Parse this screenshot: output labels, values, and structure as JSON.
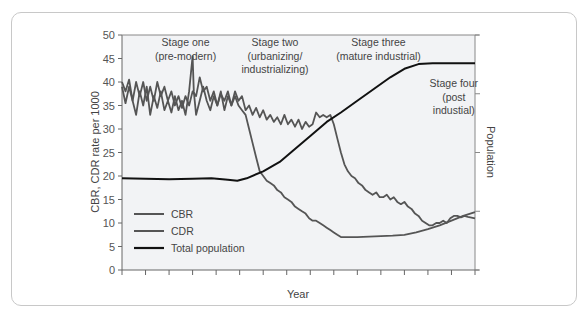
{
  "chart_data": {
    "type": "line",
    "title": "",
    "xlabel": "Year",
    "ylabel": "CBR, CDR rate per 1000",
    "ylabel_right": "Population",
    "ylim": [
      0,
      50
    ],
    "yticks": [
      0,
      5,
      10,
      15,
      20,
      25,
      30,
      35,
      40,
      45,
      50
    ],
    "xlim": [
      0,
      15
    ],
    "xtick_count": 16,
    "right_axis_ticks_count": 5,
    "grid": false,
    "legend_position": "lower-left",
    "legend": [
      "CBR",
      "CDR",
      "Total population"
    ],
    "stages": [
      {
        "label_lines": [
          "Stage one",
          "(pre-modern)"
        ],
        "x": 2.7
      },
      {
        "label_lines": [
          "Stage two",
          "(urbanizing/",
          "industrializing)"
        ],
        "x": 6.5
      },
      {
        "label_lines": [
          "Stage three",
          "(mature industrial)"
        ],
        "x": 10.9
      },
      {
        "label_lines": [
          "Stage four",
          "(post",
          "industial)"
        ],
        "x": 14.1
      }
    ],
    "series": [
      {
        "name": "CBR",
        "color": "#555555",
        "points": [
          [
            0,
            40
          ],
          [
            0.15,
            38
          ],
          [
            0.3,
            40.5
          ],
          [
            0.45,
            36
          ],
          [
            0.6,
            40
          ],
          [
            0.75,
            37
          ],
          [
            0.9,
            40
          ],
          [
            1.05,
            36
          ],
          [
            1.2,
            39
          ],
          [
            1.35,
            36
          ],
          [
            1.5,
            40
          ],
          [
            1.65,
            37
          ],
          [
            1.8,
            39
          ],
          [
            1.95,
            36
          ],
          [
            2.1,
            38
          ],
          [
            2.25,
            35
          ],
          [
            2.4,
            37
          ],
          [
            2.55,
            34.5
          ],
          [
            2.7,
            37
          ],
          [
            2.85,
            35
          ],
          [
            3.0,
            38
          ],
          [
            3.15,
            37
          ],
          [
            3.3,
            41
          ],
          [
            3.45,
            38
          ],
          [
            3.6,
            39
          ],
          [
            3.75,
            36
          ],
          [
            3.9,
            38
          ],
          [
            4.05,
            35
          ],
          [
            4.2,
            37.5
          ],
          [
            4.35,
            36
          ],
          [
            4.5,
            38
          ],
          [
            4.65,
            35
          ],
          [
            4.8,
            38
          ],
          [
            4.95,
            36
          ],
          [
            5.1,
            37
          ],
          [
            5.25,
            34
          ],
          [
            5.4,
            35
          ],
          [
            5.55,
            33
          ],
          [
            5.7,
            34.5
          ],
          [
            5.85,
            32.5
          ],
          [
            6.0,
            34
          ],
          [
            6.15,
            32
          ],
          [
            6.3,
            33
          ],
          [
            6.45,
            31.5
          ],
          [
            6.6,
            32.5
          ],
          [
            6.75,
            31
          ],
          [
            6.9,
            33
          ],
          [
            7.05,
            31
          ],
          [
            7.2,
            32
          ],
          [
            7.35,
            30.5
          ],
          [
            7.5,
            32
          ],
          [
            7.65,
            30
          ],
          [
            7.8,
            31.5
          ],
          [
            7.95,
            30.5
          ],
          [
            8.1,
            31
          ],
          [
            8.25,
            33.5
          ],
          [
            8.4,
            32.5
          ],
          [
            8.55,
            33
          ],
          [
            8.7,
            32.5
          ],
          [
            8.85,
            33
          ],
          [
            9.0,
            31
          ],
          [
            9.15,
            28
          ],
          [
            9.3,
            25
          ],
          [
            9.45,
            22.5
          ],
          [
            9.6,
            21
          ],
          [
            9.75,
            20
          ],
          [
            9.9,
            19.5
          ],
          [
            10.05,
            18.5
          ],
          [
            10.2,
            18
          ],
          [
            10.35,
            17
          ],
          [
            10.5,
            16.5
          ],
          [
            10.65,
            16
          ],
          [
            10.8,
            16.5
          ],
          [
            10.95,
            15.5
          ],
          [
            11.1,
            15.5
          ],
          [
            11.25,
            16
          ],
          [
            11.4,
            15
          ],
          [
            11.55,
            15.5
          ],
          [
            11.7,
            14.5
          ],
          [
            11.85,
            14
          ],
          [
            12.0,
            14.5
          ],
          [
            12.15,
            13.5
          ],
          [
            12.3,
            13
          ],
          [
            12.45,
            12
          ],
          [
            12.6,
            11.5
          ],
          [
            12.75,
            10.5
          ],
          [
            12.9,
            10
          ],
          [
            13.05,
            9.5
          ],
          [
            13.2,
            9.5
          ],
          [
            13.35,
            10
          ],
          [
            13.5,
            10
          ],
          [
            13.65,
            10.5
          ],
          [
            13.8,
            10
          ],
          [
            13.95,
            11
          ],
          [
            14.1,
            11.5
          ],
          [
            14.25,
            11.5
          ],
          [
            14.4,
            11.2
          ],
          [
            14.55,
            11.5
          ],
          [
            14.7,
            11.3
          ],
          [
            15,
            11
          ]
        ]
      },
      {
        "name": "CDR",
        "color": "#555555",
        "points": [
          [
            0,
            39
          ],
          [
            0.15,
            35.5
          ],
          [
            0.3,
            39
          ],
          [
            0.45,
            36
          ],
          [
            0.6,
            33
          ],
          [
            0.75,
            38
          ],
          [
            0.9,
            35
          ],
          [
            1.05,
            39
          ],
          [
            1.2,
            33
          ],
          [
            1.35,
            37
          ],
          [
            1.5,
            34.5
          ],
          [
            1.65,
            38
          ],
          [
            1.8,
            34
          ],
          [
            1.95,
            36
          ],
          [
            2.1,
            33.5
          ],
          [
            2.25,
            37
          ],
          [
            2.4,
            34
          ],
          [
            2.55,
            36
          ],
          [
            2.7,
            33
          ],
          [
            2.85,
            38
          ],
          [
            3.0,
            45.5
          ],
          [
            3.05,
            38
          ],
          [
            3.15,
            33
          ],
          [
            3.3,
            36
          ],
          [
            3.45,
            39
          ],
          [
            3.6,
            36
          ],
          [
            3.75,
            34
          ],
          [
            3.9,
            37
          ],
          [
            4.05,
            35
          ],
          [
            4.2,
            38
          ],
          [
            4.35,
            34
          ],
          [
            4.5,
            37
          ],
          [
            4.65,
            35
          ],
          [
            4.8,
            37
          ],
          [
            4.95,
            35
          ],
          [
            5.1,
            34
          ],
          [
            5.25,
            33
          ],
          [
            5.4,
            30
          ],
          [
            5.55,
            27
          ],
          [
            5.7,
            24
          ],
          [
            5.85,
            21
          ],
          [
            6.0,
            20
          ],
          [
            6.15,
            19
          ],
          [
            6.3,
            18.5
          ],
          [
            6.45,
            18
          ],
          [
            6.6,
            17
          ],
          [
            6.75,
            16.5
          ],
          [
            6.9,
            15.5
          ],
          [
            7.05,
            15
          ],
          [
            7.2,
            14.5
          ],
          [
            7.35,
            13.5
          ],
          [
            7.5,
            13
          ],
          [
            7.65,
            12.5
          ],
          [
            7.8,
            12
          ],
          [
            7.95,
            11
          ],
          [
            8.1,
            10.5
          ],
          [
            8.25,
            10.5
          ],
          [
            8.4,
            10
          ],
          [
            8.55,
            9.5
          ],
          [
            8.7,
            9
          ],
          [
            8.85,
            8.5
          ],
          [
            9.0,
            8
          ],
          [
            9.15,
            7.5
          ],
          [
            9.3,
            7
          ],
          [
            9.5,
            7
          ],
          [
            10,
            7
          ],
          [
            11,
            7.2
          ],
          [
            11.5,
            7.3
          ],
          [
            12,
            7.5
          ],
          [
            12.5,
            8
          ],
          [
            13,
            8.7
          ],
          [
            13.5,
            9.5
          ],
          [
            14,
            10.5
          ],
          [
            14.5,
            11.5
          ],
          [
            15,
            12.3
          ]
        ]
      },
      {
        "name": "Total population",
        "color": "#111111",
        "points": [
          [
            0,
            19.5
          ],
          [
            1,
            19.4
          ],
          [
            2,
            19.3
          ],
          [
            3,
            19.4
          ],
          [
            3.8,
            19.5
          ],
          [
            4.5,
            19.2
          ],
          [
            4.9,
            19.0
          ],
          [
            5.3,
            19.5
          ],
          [
            6,
            21
          ],
          [
            6.7,
            23
          ],
          [
            7.3,
            25.5
          ],
          [
            8,
            28.5
          ],
          [
            8.7,
            31.5
          ],
          [
            9.3,
            33.5
          ],
          [
            10,
            36
          ],
          [
            10.7,
            38.5
          ],
          [
            11.4,
            41
          ],
          [
            12,
            42.8
          ],
          [
            12.6,
            43.8
          ],
          [
            13.2,
            44
          ],
          [
            14,
            44
          ],
          [
            15,
            44
          ]
        ]
      }
    ]
  }
}
